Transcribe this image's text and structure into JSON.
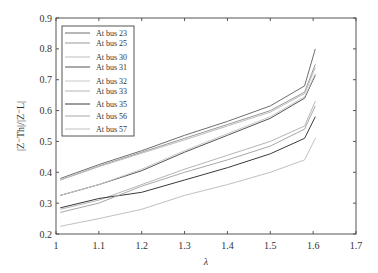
{
  "chart_data": {
    "type": "line",
    "title": "",
    "xlabel": "λ",
    "ylabel": "|Z⁻Th|/|Z⁻L|",
    "xlim": [
      1.0,
      1.7
    ],
    "ylim": [
      0.2,
      0.9
    ],
    "xticks": [
      "1",
      "1.1",
      "1.2",
      "1.3",
      "1.4",
      "1.5",
      "1.6",
      "1.7"
    ],
    "yticks": [
      "0.2",
      "0.3",
      "0.4",
      "0.5",
      "0.6",
      "0.7",
      "0.8",
      "0.9"
    ],
    "grid": false,
    "legend_position": "upper left",
    "x": [
      1.01,
      1.1,
      1.2,
      1.3,
      1.4,
      1.5,
      1.58,
      1.605
    ],
    "series": [
      {
        "name": "At bus 23",
        "color": "#6e6e6e",
        "values": [
          0.38,
          0.425,
          0.47,
          0.52,
          0.565,
          0.615,
          0.68,
          0.8
        ]
      },
      {
        "name": "At bus 25",
        "color": "#9a9a9a",
        "values": [
          0.375,
          0.42,
          0.465,
          0.51,
          0.555,
          0.6,
          0.66,
          0.75
        ]
      },
      {
        "name": "At bus 30",
        "color": "#bdbdbd",
        "values": [
          0.375,
          0.418,
          0.462,
          0.505,
          0.55,
          0.595,
          0.655,
          0.74
        ]
      },
      {
        "name": "At bus 31",
        "color": "#555555",
        "values": [
          0.325,
          0.36,
          0.405,
          0.465,
          0.52,
          0.575,
          0.64,
          0.715
        ]
      },
      {
        "name": "At bus 32",
        "color": "#c8c8c8",
        "values": [
          0.325,
          0.36,
          0.41,
          0.47,
          0.525,
          0.58,
          0.645,
          0.72
        ]
      },
      {
        "name": "At bus 33",
        "color": "#b5b5b5",
        "values": [
          0.28,
          0.31,
          0.36,
          0.41,
          0.455,
          0.5,
          0.55,
          0.63
        ]
      },
      {
        "name": "At bus 35",
        "color": "#3a3a3a",
        "values": [
          0.285,
          0.315,
          0.335,
          0.375,
          0.415,
          0.46,
          0.51,
          0.58
        ]
      },
      {
        "name": "At bus 56",
        "color": "#a8a8a8",
        "values": [
          0.27,
          0.3,
          0.355,
          0.4,
          0.44,
          0.485,
          0.54,
          0.615
        ]
      },
      {
        "name": "At bus 57",
        "color": "#c0c0c0",
        "values": [
          0.225,
          0.25,
          0.28,
          0.325,
          0.36,
          0.4,
          0.44,
          0.51
        ]
      }
    ]
  },
  "legend": {
    "items": [
      "At bus 23",
      "At bus 25",
      "At bus 30",
      "At bus 31",
      "At bus 32",
      "At bus 33",
      "At bus 35",
      "At bus 56",
      "At bus 57"
    ]
  }
}
